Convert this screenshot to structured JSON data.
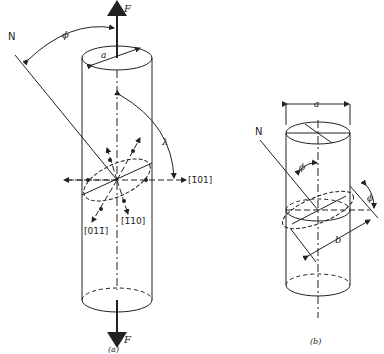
{
  "figure_a": {
    "caption": "(a)",
    "force_top": "F",
    "force_bottom": "F",
    "normal_label": "N",
    "phi_label": "ϕ",
    "lambda_label": "λ",
    "diameter_label": "a",
    "direction_labels": {
      "d1": "[1̄01]",
      "d2": "[011̄]",
      "d3": "[1̄10]"
    }
  },
  "figure_b": {
    "caption": "(b)",
    "normal_label": "N",
    "phi_label_inner": "ϕ",
    "phi_label_outer": "ϕ",
    "diameter_label": "a",
    "length_label": "b"
  }
}
